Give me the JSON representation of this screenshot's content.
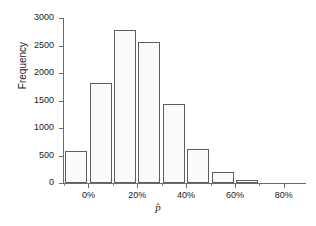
{
  "chart_data": {
    "type": "bar",
    "title": "",
    "subtitle": "",
    "xlabel": "p̂",
    "ylabel": "Frequency",
    "xlim": [
      -10,
      85
    ],
    "ylim": [
      0,
      3000
    ],
    "grid": false,
    "legend": null,
    "x_tick_labels": [
      "0%",
      "20%",
      "40%",
      "60%",
      "80%"
    ],
    "x_tick_values": [
      0,
      20,
      40,
      60,
      80
    ],
    "x_minor_tick_values": [
      -10,
      10,
      30,
      50,
      70
    ],
    "y_tick_labels": [
      "0",
      "500",
      "1000",
      "1500",
      "2000",
      "2500",
      "3000"
    ],
    "y_tick_values": [
      0,
      500,
      1000,
      1500,
      2000,
      2500,
      3000
    ],
    "bin_width": 10,
    "categories": [
      "-5%",
      "5%",
      "15%",
      "25%",
      "35%",
      "45%",
      "55%",
      "65%"
    ],
    "bins": [
      {
        "left": -10,
        "right": 0,
        "center": -5,
        "value": 580
      },
      {
        "left": 0,
        "right": 10,
        "center": 5,
        "value": 1825
      },
      {
        "left": 10,
        "right": 20,
        "center": 15,
        "value": 2790
      },
      {
        "left": 20,
        "right": 30,
        "center": 25,
        "value": 2565
      },
      {
        "left": 30,
        "right": 40,
        "center": 35,
        "value": 1435
      },
      {
        "left": 40,
        "right": 50,
        "center": 45,
        "value": 620
      },
      {
        "left": 50,
        "right": 60,
        "center": 55,
        "value": 200
      },
      {
        "left": 60,
        "right": 70,
        "center": 65,
        "value": 48
      }
    ],
    "values": [
      580,
      1825,
      2790,
      2565,
      1435,
      620,
      200,
      48
    ],
    "colors": {
      "bar_fill": "#fafafa",
      "bar_edge": "#5e5e5e",
      "axis": "#6b6b6b",
      "text": "#1a1a1a",
      "background": "#ffffff"
    }
  }
}
